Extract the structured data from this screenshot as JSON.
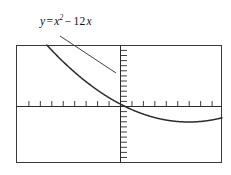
{
  "figure": {
    "background_color": "#ffffff",
    "line_color": "#2b2b2b",
    "text_color": "#111111"
  },
  "callout": {
    "equation_full": "y = x² −12x",
    "lhs": "y",
    "equals": "=",
    "term_base": "x",
    "term_exponent": "2",
    "minus": "−",
    "coefficient": "12",
    "variable": "x",
    "border_color": "#3a3a3a"
  },
  "leader_line": {
    "from_x": 60,
    "from_y": 36,
    "to_x": 116,
    "to_y": 73
  },
  "plot_frame": {
    "left": 16,
    "top": 45,
    "right": 222,
    "bottom": 163,
    "border_color": "#3a3a3a"
  },
  "axes": {
    "x_axis_y": 106,
    "y_axis_x": 120,
    "x_tick_spacing": 11.45,
    "x_tick_length": 5,
    "y_tick_spacing": 5.1,
    "y_tick_length": 6
  },
  "chart_data": {
    "type": "line",
    "xlabel": "",
    "ylabel": "",
    "grid": false,
    "legend": false,
    "annotations": [
      "y = x² −12x"
    ],
    "xlim": [
      -9.1,
      8.9
    ],
    "ylim": [
      -118,
      118
    ],
    "x_tick_step": 1,
    "y_tick_step": 5,
    "x_tick_count": 18,
    "y_tick_count": 46,
    "series": [
      {
        "name": "y = x^2 - 12x",
        "equation": "y = x^2 - 12x",
        "x": [
          -0.52,
          -0.45,
          -0.38,
          -0.31,
          -0.24,
          -0.17,
          -0.1,
          -0.03,
          0.04,
          0.11,
          0.18,
          0.25,
          0.32,
          0.39,
          0.46,
          0.53,
          0.6,
          0.67,
          0.74,
          0.81,
          0.88,
          0.95
        ],
        "values": [
          6.54,
          5.6,
          4.7,
          3.81,
          2.94,
          2.07,
          1.21,
          0.36,
          -0.48,
          -1.31,
          -2.13,
          -2.94,
          -3.74,
          -4.53,
          -5.3,
          -6.08,
          -6.84,
          -7.6,
          -8.34,
          -9.08,
          -9.78,
          -10.5
        ]
      }
    ]
  }
}
